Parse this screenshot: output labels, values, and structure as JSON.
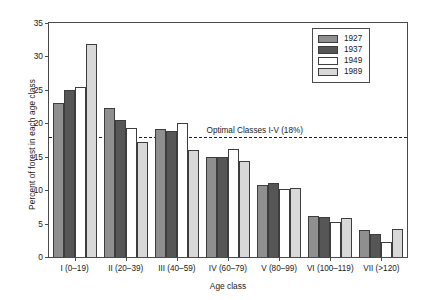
{
  "chart_data": {
    "type": "bar",
    "title": "",
    "xlabel": "Age class",
    "ylabel": "Percent of forest in each age class",
    "ylim": [
      0,
      35
    ],
    "yticks": [
      0,
      5,
      10,
      15,
      20,
      25,
      30,
      35
    ],
    "grid": false,
    "legend_position": "top-right",
    "categories": [
      "I (0–19)",
      "II (20–39)",
      "III (40–59)",
      "IV (60–79)",
      "V (80–99)",
      "VI (100–119)",
      "VII (>120)"
    ],
    "series": [
      {
        "name": "1927",
        "color": "#8f8f8f",
        "values": [
          23.1,
          22.3,
          19.1,
          15.0,
          10.7,
          6.2,
          4.0
        ]
      },
      {
        "name": "1937",
        "color": "#565656",
        "values": [
          25.0,
          20.5,
          18.8,
          15.0,
          11.0,
          6.0,
          3.5
        ]
      },
      {
        "name": "1949",
        "color": "#ffffff",
        "values": [
          25.5,
          19.3,
          20.1,
          16.1,
          10.2,
          5.2,
          2.2
        ]
      },
      {
        "name": "1989",
        "color": "#d8d8d8",
        "values": [
          31.9,
          17.2,
          16.0,
          14.3,
          10.3,
          5.9,
          4.2
        ]
      }
    ],
    "annotations": [
      {
        "text": "Optimal Classes I-V (18%)",
        "value": 18,
        "style": "dashed-horizontal-line"
      }
    ]
  }
}
